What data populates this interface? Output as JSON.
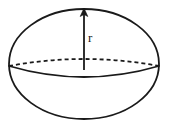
{
  "figure": {
    "name": "sphere-radius-diagram",
    "background_color": "#ffffff",
    "stroke_color": "#1a1a1a",
    "geometry": {
      "outline": {
        "shape": "ellipse",
        "center_x": 84,
        "center_y": 64,
        "radius_x": 75,
        "radius_y": 55,
        "stroke_width": 1.8,
        "fill": "none"
      },
      "equator_back": {
        "shape": "arc",
        "style": "dashed",
        "dash_pattern": "4 3",
        "stroke_width": 1.8,
        "from_x": 9,
        "to_x": 159,
        "y": 66,
        "bow_y": 60
      },
      "equator_front": {
        "shape": "arc",
        "style": "solid",
        "stroke_width": 1.8,
        "from_x": 9,
        "to_x": 159,
        "y": 66,
        "bow_y": 82
      },
      "radius_arrow": {
        "style": "solid-with-arrowhead",
        "stroke_width": 1.8,
        "x": 84,
        "from_y": 70,
        "to_y": 10,
        "arrowhead_width": 7,
        "arrowhead_height": 8,
        "direction": "up"
      }
    },
    "labels": {
      "radius": "r"
    }
  }
}
